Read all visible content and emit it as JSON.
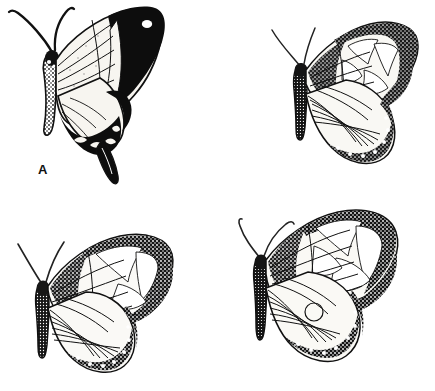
{
  "plate": {
    "kind": "scientific-illustration-plate",
    "layout": "2x2 grid of butterfly line drawings",
    "background_color": "#ffffff",
    "ink_color": "#111111",
    "width_px": 435,
    "height_px": 391
  },
  "panels": [
    {
      "label": "A",
      "subject": "swallowtail butterfly, lateral view with tail",
      "orientation": "facing left, wings folded upward to the right",
      "features": [
        "two long curved antennae sweeping up and left",
        "stippled speckled body and thorax",
        "pale cream forewing with radiating dark veins",
        "broad solid black forewing apex and outer margin",
        "single white oval eyespot inside the black apex",
        "black hindwing margin with pale crescent lunules",
        "long pointed black tail extending down"
      ],
      "wing_fill": "#f7f5f0",
      "margin_fill": "#0d0d0d"
    },
    {
      "label": "B",
      "subject": "mimic butterfly, lateral view",
      "orientation": "facing left, wings fanned to the right",
      "features": [
        "two slender antennae sweeping up and left",
        "heavily stippled dark body and abdomen",
        "pale forewing cells bordered by stippled veins",
        "speckled granular outer wing margin with pale spots",
        "rounded fan-shaped hindwing with radiating veins",
        "scalloped stippled hindwing edge"
      ],
      "wing_fill": "#f9f8f4",
      "margin_fill": "#1a1a1a"
    },
    {
      "label": "C",
      "subject": "mimic butterfly, lateral view",
      "orientation": "facing left, wings fanned to the right",
      "features": [
        "two long thin antennae sweeping up and left",
        "banded stippled abdomen",
        "large pale forewing patch near the apex",
        "granular stippled leading edge and apex",
        "broad pale hindwing with fine radiating veins",
        "dark speckled hindwing margin with white dots"
      ],
      "wing_fill": "#faf9f6",
      "margin_fill": "#161616"
    },
    {
      "label": "D",
      "subject": "mimic butterfly, lateral view",
      "orientation": "facing left, wings fanned to the right",
      "features": [
        "two curved antennae sweeping up and left",
        "stippled thorax and banded abdomen",
        "pale rectangular cells along the forewing",
        "dense speckled apex and outer margin",
        "pale hindwing with a small circular discal mark",
        "broad dark stippled hindwing border"
      ],
      "wing_fill": "#faf9f5",
      "margin_fill": "#141414"
    }
  ],
  "labels": {
    "a": "A",
    "b": "B",
    "c": "C",
    "d": "D"
  }
}
